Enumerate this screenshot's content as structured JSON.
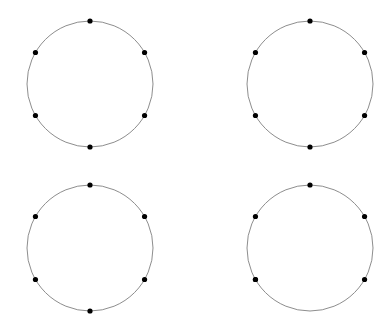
{
  "figure": {
    "title": "",
    "width": 391,
    "height": 333,
    "background_color": "#ffffff",
    "layout": {
      "rows": 2,
      "cols": 2,
      "panel_count": 4
    }
  },
  "style": {
    "circle_stroke_color": "#808080",
    "circle_stroke_width": 0.9,
    "dot_fill_color": "#000000",
    "dot_radius": 2.6
  },
  "chart_data": {
    "type": "scatter",
    "title": "",
    "xlabel": "",
    "ylabel": "",
    "grid": false,
    "legend": null,
    "panels": [
      {
        "name": "top-left",
        "center": [
          90,
          84
        ],
        "radius": 63,
        "point_count": 6,
        "angles_deg": [
          90,
          150,
          210,
          270,
          330,
          30
        ],
        "points": [
          [
            90,
            21
          ],
          [
            58.5,
            38.5
          ],
          [
            58.5,
            129.5
          ],
          [
            90,
            147
          ],
          [
            144.5,
            129.5
          ],
          [
            144.5,
            38.5
          ]
        ]
      },
      {
        "name": "top-right",
        "center": [
          310,
          84
        ],
        "radius": 63,
        "point_count": 6,
        "angles_deg": [
          90,
          150,
          210,
          270,
          330,
          30
        ],
        "points": [
          [
            310,
            21
          ],
          [
            255.5,
            52.5
          ],
          [
            255.5,
            115.5
          ],
          [
            310,
            147
          ],
          [
            364.5,
            115.5
          ],
          [
            364.5,
            52.5
          ]
        ]
      },
      {
        "name": "bottom-left",
        "center": [
          90,
          248
        ],
        "radius": 63,
        "point_count": 6,
        "angles_deg": [
          90,
          150,
          210,
          270,
          330,
          30
        ],
        "points": [
          [
            90,
            185
          ],
          [
            35.5,
            216.5
          ],
          [
            35.5,
            279.5
          ],
          [
            90,
            311
          ],
          [
            144.5,
            279.5
          ],
          [
            144.5,
            216.5
          ]
        ]
      },
      {
        "name": "bottom-right",
        "center": [
          310,
          248
        ],
        "radius": 63,
        "point_count": 6,
        "angles_deg": [
          90,
          150,
          210,
          210,
          330,
          30
        ],
        "points": [
          [
            310,
            185
          ],
          [
            255.5,
            216.5
          ],
          [
            255.5,
            279.5
          ],
          [
            310,
            311
          ],
          [
            364.5,
            279.5
          ],
          [
            364.5,
            216.5
          ]
        ]
      }
    ]
  }
}
